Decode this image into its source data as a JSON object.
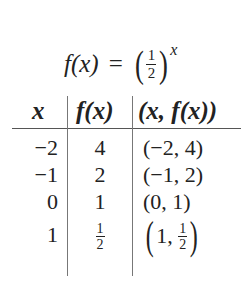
{
  "equation": {
    "lhs": "f(x)",
    "equals": "=",
    "base_numerator": "1",
    "base_denominator": "2",
    "exponent": "x"
  },
  "table": {
    "headers": [
      "x",
      "f(x)",
      "(x, f(x))"
    ],
    "rows": [
      {
        "x": "−2",
        "fx": "4",
        "pair": "(−2, 4)"
      },
      {
        "x": "−1",
        "fx": "2",
        "pair": "(−1, 2)"
      },
      {
        "x": "0",
        "fx": "1",
        "pair": "(0, 1)"
      },
      {
        "x": "1",
        "fx_num": "1",
        "fx_den": "2",
        "pair_x": "1",
        "pair_num": "1",
        "pair_den": "2"
      }
    ]
  }
}
